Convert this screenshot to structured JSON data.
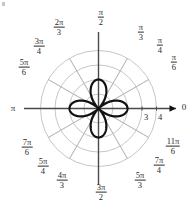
{
  "figure": {
    "background_color": "#ffffff",
    "width": 195,
    "height": 212
  },
  "chart_data": {
    "type": "line",
    "subtype": "polar-rose",
    "title": "",
    "xlabel": "",
    "ylabel": "",
    "curve_equation": "r = 2 cos(2θ)",
    "petal_count": 4,
    "petal_max_radius": 2,
    "petal_axis_angles_deg": [
      0,
      90,
      180,
      270
    ],
    "curve_color": "#111111",
    "curve_line_width": 2.2,
    "grid": true,
    "grid_color": "#b8b8b8",
    "axis_color": "#4a4a4a",
    "radial_ticks": [
      1,
      2,
      3,
      4
    ],
    "radial_tick_labels_shown": [
      "3",
      "4"
    ],
    "radial_limit": 4,
    "angular_gridline_count": 12,
    "angular_grid_step_deg": 30,
    "legend": "none",
    "center_origin_label": "",
    "axis_arrow_label": "0",
    "theta_samples": 720
  },
  "angle_labels": [
    {
      "name": "angle-0",
      "text": "0",
      "kind": "plain",
      "num": "",
      "den": "",
      "x": 184,
      "y": 107,
      "deg": 0
    },
    {
      "name": "angle-pi-6",
      "text": "π/6",
      "kind": "frac",
      "num": "π",
      "den": "6",
      "x": 174,
      "y": 62,
      "deg": 30
    },
    {
      "name": "angle-pi-4",
      "text": "π/4",
      "kind": "frac",
      "num": "π",
      "den": "4",
      "x": 160,
      "y": 45,
      "deg": 45
    },
    {
      "name": "angle-pi-3",
      "text": "π/3",
      "kind": "frac",
      "num": "π",
      "den": "3",
      "x": 141,
      "y": 32,
      "deg": 60
    },
    {
      "name": "angle-pi-2",
      "text": "π/2",
      "kind": "frac",
      "num": "π",
      "den": "2",
      "x": 101,
      "y": 17,
      "deg": 90
    },
    {
      "name": "angle-2pi-3",
      "text": "2π/3",
      "kind": "frac",
      "num": "2π",
      "den": "3",
      "x": 59,
      "y": 27,
      "deg": 120
    },
    {
      "name": "angle-3pi-4",
      "text": "3π/4",
      "kind": "frac",
      "num": "3π",
      "den": "4",
      "x": 39,
      "y": 46,
      "deg": 135
    },
    {
      "name": "angle-5pi-6",
      "text": "5π/6",
      "kind": "frac",
      "num": "5π",
      "den": "6",
      "x": 24,
      "y": 67,
      "deg": 150
    },
    {
      "name": "angle-pi",
      "text": "π",
      "kind": "plain",
      "num": "",
      "den": "",
      "x": 13,
      "y": 108,
      "deg": 180
    },
    {
      "name": "angle-7pi-6",
      "text": "7π/6",
      "kind": "frac",
      "num": "7π",
      "den": "6",
      "x": 27,
      "y": 147,
      "deg": 210
    },
    {
      "name": "angle-5pi-4",
      "text": "5π/4",
      "kind": "frac",
      "num": "5π",
      "den": "4",
      "x": 43,
      "y": 166,
      "deg": 225
    },
    {
      "name": "angle-4pi-3",
      "text": "4π/3",
      "kind": "frac",
      "num": "4π",
      "den": "3",
      "x": 62,
      "y": 180,
      "deg": 240
    },
    {
      "name": "angle-3pi-2",
      "text": "3π/2",
      "kind": "frac",
      "num": "3π",
      "den": "2",
      "x": 101,
      "y": 192,
      "deg": 270
    },
    {
      "name": "angle-5pi-3",
      "text": "5π/3",
      "kind": "frac",
      "num": "5π",
      "den": "3",
      "x": 140,
      "y": 180,
      "deg": 300
    },
    {
      "name": "angle-7pi-4",
      "text": "7π/4",
      "kind": "frac",
      "num": "7π",
      "den": "4",
      "x": 159,
      "y": 165,
      "deg": 315
    },
    {
      "name": "angle-11pi-6",
      "text": "11π/6",
      "kind": "frac",
      "num": "11π",
      "den": "6",
      "x": 173,
      "y": 146,
      "deg": 330
    }
  ],
  "radial_tick_labels": [
    {
      "name": "radial-tick-3",
      "text": "3",
      "x": 146,
      "y": 117,
      "r": 3
    },
    {
      "name": "radial-tick-4",
      "text": "4",
      "x": 160,
      "y": 117,
      "r": 4
    }
  ]
}
